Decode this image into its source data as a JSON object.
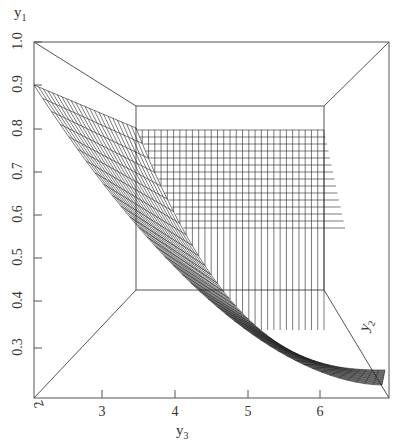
{
  "chart_data": {
    "type": "surface3d",
    "title": "",
    "axes": {
      "y1": {
        "label": "y1",
        "ticks": [
          "1.0",
          "0.9",
          "0.8",
          "0.7",
          "0.6",
          "0.5",
          "0.4",
          "0.3"
        ],
        "range": [
          0.25,
          1.0
        ]
      },
      "y3": {
        "label": "y3",
        "ticks": [
          "2",
          "3",
          "4",
          "5",
          "6"
        ],
        "range": [
          2,
          7
        ]
      },
      "y2": {
        "label": "y2",
        "ticks": [
          "2",
          "3",
          "4",
          "5",
          "6"
        ],
        "range": [
          2,
          7
        ]
      }
    },
    "surface_samples": {
      "front_edge_y3": [
        2,
        3,
        4,
        5,
        6,
        6.9
      ],
      "front_edge_y1": [
        0.89,
        0.75,
        0.55,
        0.4,
        0.3,
        0.22
      ],
      "back_edge_y1": 0.8
    },
    "grid": false,
    "legend": null
  },
  "labels": {
    "y1": "y",
    "y1_sub": "1",
    "y3": "y",
    "y3_sub": "3",
    "y2": "y",
    "y2_sub": "2"
  },
  "y_ticks": [
    {
      "label": "1.0",
      "y": 42
    },
    {
      "label": "0.9",
      "y": 85
    },
    {
      "label": "0.8",
      "y": 129
    },
    {
      "label": "0.7",
      "y": 172
    },
    {
      "label": "0.6",
      "y": 215
    },
    {
      "label": "0.5",
      "y": 258
    },
    {
      "label": "0.4",
      "y": 301
    },
    {
      "label": "0.3",
      "y": 348
    }
  ],
  "x_ticks": [
    {
      "label": "3",
      "x": 102
    },
    {
      "label": "4",
      "x": 175
    },
    {
      "label": "5",
      "x": 248
    },
    {
      "label": "6",
      "x": 320
    }
  ],
  "corner_tick": "2",
  "y2_ticks": [
    "2",
    "3",
    "4",
    "5",
    "6"
  ]
}
